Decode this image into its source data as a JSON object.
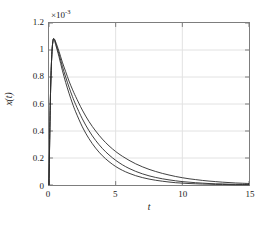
{
  "chart_data": {
    "type": "line",
    "title": "",
    "xlabel": "t",
    "ylabel": "x(t)",
    "y_exponent_prefix": "×10",
    "y_exponent_value": "-3",
    "y_scale_note": "×10⁻³",
    "xlim": [
      0,
      15
    ],
    "ylim": [
      0,
      1.2
    ],
    "xticks": [
      0,
      5,
      10,
      15
    ],
    "xtick_labels": [
      "0",
      "5",
      "10",
      "15"
    ],
    "yticks": [
      0,
      0.2,
      0.4,
      0.6,
      0.8,
      1,
      1.2
    ],
    "ytick_labels": [
      "0",
      "0.2",
      "0.4",
      "0.6",
      "0.8",
      "1",
      "1.2"
    ],
    "grid": true,
    "grid_color": "#e2e2e2",
    "axis_color": "#7d7d7d",
    "legend": "none",
    "line_color": "#2b2b2b",
    "series": [
      {
        "name": "curve-1",
        "description": "slowest decay, uppermost tail",
        "x": [
          0,
          0.1,
          0.2,
          0.3,
          0.4,
          0.5,
          0.75,
          1,
          1.25,
          1.5,
          1.75,
          2,
          2.5,
          3,
          3.5,
          4,
          4.5,
          5,
          5.5,
          6,
          6.5,
          7,
          7.5,
          8,
          8.5,
          9,
          9.5,
          10,
          10.5,
          11,
          11.5,
          12,
          12.5,
          13,
          13.5,
          14,
          14.5,
          15
        ],
        "y": [
          0,
          0.62,
          0.94,
          1.07,
          1.08,
          1.06,
          0.99,
          0.91,
          0.84,
          0.77,
          0.71,
          0.655,
          0.555,
          0.47,
          0.4,
          0.34,
          0.29,
          0.248,
          0.213,
          0.183,
          0.157,
          0.135,
          0.116,
          0.1,
          0.086,
          0.074,
          0.063,
          0.054,
          0.046,
          0.04,
          0.034,
          0.029,
          0.025,
          0.021,
          0.018,
          0.015,
          0.013,
          0.011
        ]
      },
      {
        "name": "curve-2",
        "description": "intermediate decay",
        "x": [
          0,
          0.1,
          0.2,
          0.3,
          0.4,
          0.5,
          0.75,
          1,
          1.25,
          1.5,
          1.75,
          2,
          2.5,
          3,
          3.5,
          4,
          4.5,
          5,
          5.5,
          6,
          6.5,
          7,
          7.5,
          8,
          8.5,
          9,
          9.5,
          10,
          10.5,
          11,
          11.5,
          12,
          12.5,
          13,
          13.5,
          14,
          14.5,
          15
        ],
        "y": [
          0,
          0.62,
          0.94,
          1.07,
          1.08,
          1.05,
          0.97,
          0.88,
          0.8,
          0.725,
          0.657,
          0.596,
          0.49,
          0.402,
          0.33,
          0.271,
          0.223,
          0.183,
          0.15,
          0.123,
          0.101,
          0.083,
          0.068,
          0.056,
          0.046,
          0.038,
          0.031,
          0.025,
          0.021,
          0.017,
          0.014,
          0.011,
          0.009,
          0.008,
          0.006,
          0.005,
          0.004,
          0.004
        ]
      },
      {
        "name": "curve-3",
        "description": "fastest decay, lowest tail",
        "x": [
          0,
          0.1,
          0.2,
          0.3,
          0.4,
          0.5,
          0.75,
          1,
          1.25,
          1.5,
          1.75,
          2,
          2.5,
          3,
          3.5,
          4,
          4.5,
          5,
          5.5,
          6,
          6.5,
          7,
          7.5,
          8,
          8.5,
          9,
          9.5,
          10,
          10.5,
          11,
          11.5,
          12,
          12.5,
          13,
          13.5,
          14,
          14.5,
          15
        ],
        "y": [
          0,
          0.62,
          0.94,
          1.07,
          1.07,
          1.04,
          0.95,
          0.85,
          0.76,
          0.68,
          0.607,
          0.542,
          0.431,
          0.343,
          0.273,
          0.217,
          0.173,
          0.137,
          0.109,
          0.087,
          0.069,
          0.055,
          0.044,
          0.035,
          0.028,
          0.022,
          0.017,
          0.014,
          0.011,
          0.009,
          0.007,
          0.006,
          0.004,
          0.004,
          0.003,
          0.002,
          0.002,
          0.002
        ]
      }
    ]
  }
}
